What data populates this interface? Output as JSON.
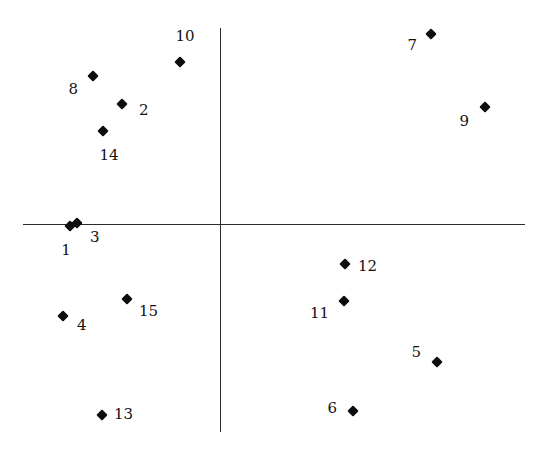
{
  "figure": {
    "width": 546,
    "height": 449,
    "background": "#ffffff",
    "marker_color": "#0d0d0d",
    "axis_color": "#2b2b2b",
    "label_color": "#121212",
    "caption_partial": "."
  },
  "axes": {
    "origin_x": 220,
    "origin_y": 224,
    "x_axis_start": 23,
    "x_axis_end": 525,
    "y_axis_start": 28,
    "y_axis_end": 432
  },
  "chart_data": {
    "type": "scatter",
    "title": "",
    "xlabel": "",
    "ylabel": "",
    "xlim": [
      -197,
      305
    ],
    "ylim": [
      -208,
      196
    ],
    "grid": false,
    "legend": null,
    "axis_style": "crosshair-through-origin",
    "marker": "filled-diamond",
    "point_count": 15,
    "points": [
      {
        "label": "1",
        "px": 70,
        "py": 226,
        "x": -150,
        "y": -2,
        "label_px": 66,
        "label_py": 243,
        "anchor": "below"
      },
      {
        "label": "2",
        "px": 122,
        "py": 104,
        "x": -98,
        "y": 120,
        "label_px": 139,
        "label_py": 110,
        "anchor": "right"
      },
      {
        "label": "3",
        "px": 77,
        "py": 223,
        "x": -143,
        "y": 1,
        "label_px": 90,
        "label_py": 237,
        "anchor": "right"
      },
      {
        "label": "4",
        "px": 63,
        "py": 316,
        "x": -157,
        "y": -92,
        "label_px": 77,
        "label_py": 325,
        "anchor": "right"
      },
      {
        "label": "5",
        "px": 437,
        "py": 362,
        "x": 217,
        "y": -138,
        "label_px": 421,
        "label_py": 352,
        "anchor": "left"
      },
      {
        "label": "6",
        "px": 353,
        "py": 411,
        "x": 133,
        "y": -187,
        "label_px": 337,
        "label_py": 408,
        "anchor": "left"
      },
      {
        "label": "7",
        "px": 431,
        "py": 34,
        "x": 211,
        "y": 190,
        "label_px": 417,
        "label_py": 45,
        "anchor": "left"
      },
      {
        "label": "8",
        "px": 93,
        "py": 76,
        "x": -127,
        "y": 148,
        "label_px": 78,
        "label_py": 89,
        "anchor": "left"
      },
      {
        "label": "9",
        "px": 485,
        "py": 107,
        "x": 265,
        "y": 117,
        "label_px": 469,
        "label_py": 121,
        "anchor": "left"
      },
      {
        "label": "10",
        "px": 180,
        "py": 62,
        "x": -40,
        "y": 162,
        "label_px": 185,
        "label_py": 44,
        "anchor": "above"
      },
      {
        "label": "11",
        "px": 344,
        "py": 301,
        "x": 124,
        "y": -77,
        "label_px": 329,
        "label_py": 313,
        "anchor": "left"
      },
      {
        "label": "12",
        "px": 345,
        "py": 264,
        "x": 125,
        "y": -40,
        "label_px": 358,
        "label_py": 266,
        "anchor": "right"
      },
      {
        "label": "13",
        "px": 102,
        "py": 415,
        "x": -118,
        "y": -191,
        "label_px": 114,
        "label_py": 414,
        "anchor": "right"
      },
      {
        "label": "14",
        "px": 103,
        "py": 131,
        "x": -117,
        "y": 93,
        "label_px": 109,
        "label_py": 148,
        "anchor": "below"
      },
      {
        "label": "15",
        "px": 127,
        "py": 299,
        "x": -93,
        "y": -75,
        "label_px": 139,
        "label_py": 311,
        "anchor": "right"
      }
    ]
  }
}
